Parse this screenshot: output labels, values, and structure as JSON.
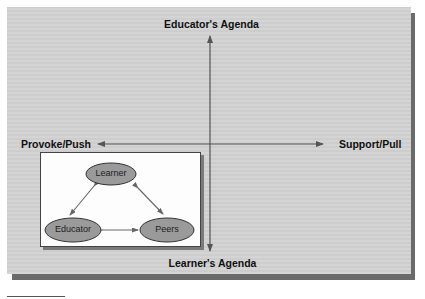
{
  "diagram": {
    "axes": {
      "top_label": "Educator's Agenda",
      "bottom_label": "Learner's Agenda",
      "left_label": "Provoke/Push",
      "right_label": "Support/Pull"
    },
    "inset": {
      "nodes": [
        {
          "id": "learner",
          "label": "Learner"
        },
        {
          "id": "educator",
          "label": "Educator"
        },
        {
          "id": "peers",
          "label": "Peers"
        }
      ],
      "edges": [
        {
          "from": "learner",
          "to": "educator",
          "type": "bidirectional"
        },
        {
          "from": "learner",
          "to": "peers",
          "type": "bidirectional"
        },
        {
          "from": "educator",
          "to": "peers",
          "type": "bidirectional"
        }
      ]
    },
    "colors": {
      "panel_background": "#d2d2d2",
      "panel_shadow": "#6a6a6a",
      "axis_line": "#555555",
      "node_fill": "#9a9a9a",
      "node_stroke": "#333333",
      "inset_background": "#fdfdfd"
    }
  }
}
